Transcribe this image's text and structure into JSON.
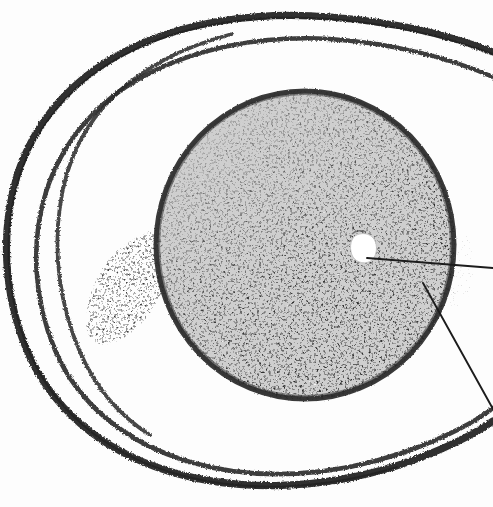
{
  "figure": {
    "kind": "scanned-micrograph-plate",
    "caption_visible": false,
    "plate_number": "",
    "background_color": "#fdfdfd",
    "ink_color": "#232323",
    "ovum_fill_color": "#d0d0d0",
    "ovum_rim_color": "#2a2a2a",
    "vacuole_color": "#ffffff",
    "speckle_color": "#3a3a3a"
  },
  "structures": {
    "ovum": {
      "label": "ovum-body",
      "center_x": 305,
      "center_y": 245,
      "radius_x": 150,
      "radius_y": 155,
      "fill": "#d0d0d0",
      "rim_width": 6,
      "description": "large pale grey spherical body with dark granular rim"
    },
    "membranes": [
      {
        "label": "outer-membrane-line",
        "stroke_width": 7,
        "description": "outermost heavy curved shell line, open at right"
      },
      {
        "label": "middle-membrane-line",
        "stroke_width": 5,
        "description": "second concentric curved line running parallel inside the outer line"
      },
      {
        "label": "inner-membrane-line",
        "stroke_width": 4,
        "description": "short third curved line branching at upper left and merging at lower left"
      }
    ],
    "vacuole": {
      "label": "white-vacuole-spot",
      "center_x": 363,
      "center_y": 248,
      "radius_x": 12,
      "radius_y": 13,
      "fill": "#ffffff"
    },
    "granular_patch": {
      "label": "left-granular-patch",
      "center_x": 128,
      "center_y": 283,
      "width": 95,
      "height": 120,
      "description": "loose stippled cluster of dark granules outside the ovum on the left"
    },
    "granular_zone": {
      "label": "lower-granular-zone",
      "description": "dense speckled pigment covering the lower and right portion of the ovum"
    }
  },
  "leader_lines": [
    {
      "label": "leader-line-vacuole",
      "from_x": 367,
      "from_y": 258,
      "to_x": 493,
      "to_y": 268,
      "stroke_width": 2,
      "target_structure": "white-vacuole-spot",
      "annotation_text": ""
    },
    {
      "label": "leader-line-rim",
      "from_x": 423,
      "from_y": 283,
      "to_x": 493,
      "to_y": 408,
      "stroke_width": 2,
      "target_structure": "ovum-rim",
      "annotation_text": ""
    }
  ],
  "annotations": {
    "labels_cut_off": true,
    "note": ""
  }
}
